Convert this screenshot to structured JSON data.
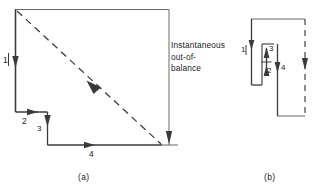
{
  "figure": {
    "type": "vector-loop-diagram",
    "background_color": "#ffffff",
    "line_color": "#3a3a3a",
    "text_color": "#222222",
    "panels": [
      {
        "id": "a",
        "caption": "(a)",
        "annotation": {
          "line1": "Instantaneous",
          "line2": "out-of-",
          "line3": "balance"
        },
        "segment_labels": [
          {
            "name": "1",
            "text": "1"
          },
          {
            "name": "2",
            "text": "2"
          },
          {
            "name": "3",
            "text": "3"
          },
          {
            "name": "4",
            "text": "4"
          }
        ]
      },
      {
        "id": "b",
        "caption": "(b)",
        "segment_labels": [
          {
            "name": "1",
            "text": "1"
          },
          {
            "name": "2",
            "text": "2"
          },
          {
            "name": "3",
            "text": "3"
          },
          {
            "name": "4",
            "text": "4"
          }
        ]
      }
    ]
  }
}
